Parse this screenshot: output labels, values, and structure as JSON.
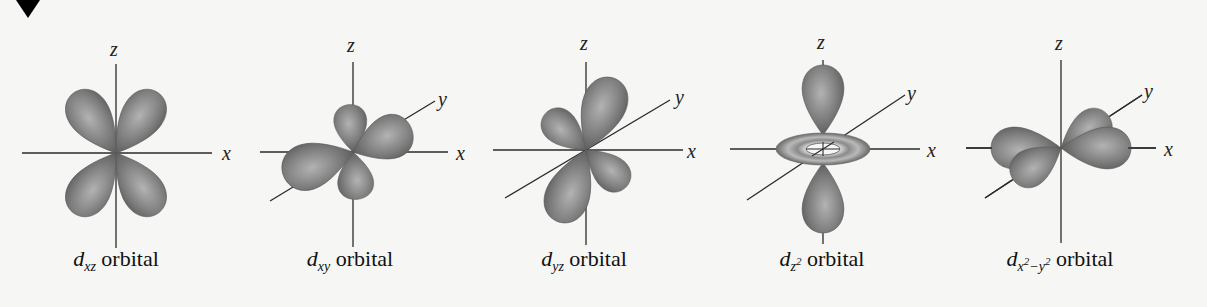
{
  "figure": {
    "marker": "triangle-down",
    "lobe_color": "#6e6e6e",
    "axis_color": "#2a2a2a",
    "background": "#f6f6f4",
    "orbitals": [
      {
        "id": "dxz",
        "letter": "d",
        "sub": "xz",
        "suffix": "orbital",
        "axes": [
          "z",
          "x"
        ]
      },
      {
        "id": "dxy",
        "letter": "d",
        "sub": "xy",
        "suffix": "orbital",
        "axes": [
          "z",
          "y",
          "x"
        ]
      },
      {
        "id": "dyz",
        "letter": "d",
        "sub": "yz",
        "suffix": "orbital",
        "axes": [
          "z",
          "y",
          "x"
        ]
      },
      {
        "id": "dz2",
        "letter": "d",
        "sub": "z",
        "sub_sup": "2",
        "suffix": "orbital",
        "axes": [
          "z",
          "y",
          "x"
        ]
      },
      {
        "id": "dx2y2",
        "letter": "d",
        "sub": "x",
        "sub_sup1": "2",
        "sub_mid": "−y",
        "sub_sup2": "2",
        "suffix": "orbital",
        "axes": [
          "z",
          "y",
          "x"
        ]
      }
    ]
  }
}
